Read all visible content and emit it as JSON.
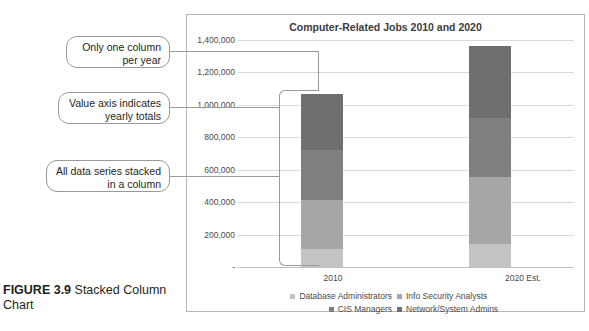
{
  "figure": {
    "label": "FIGURE 3.9",
    "caption": " Stacked Column Chart"
  },
  "callouts": [
    {
      "id": "one-column",
      "text": "Only one column per year"
    },
    {
      "id": "value-axis",
      "text": "Value axis indicates yearly totals"
    },
    {
      "id": "stacked",
      "text": "All data series stacked in a column"
    }
  ],
  "chart_data": {
    "type": "bar",
    "subtype": "stacked-column",
    "title": "Computer-Related Jobs 2010 and 2020",
    "xlabel": "",
    "ylabel": "",
    "categories": [
      "2010",
      "2020 Est."
    ],
    "ytick_labels": [
      "-",
      "200,000",
      "400,000",
      "600,000",
      "800,000",
      "1,000,000",
      "1,200,000",
      "1,400,000"
    ],
    "ytick_values": [
      0,
      200000,
      400000,
      600000,
      800000,
      1000000,
      1200000,
      1400000
    ],
    "ylim": [
      0,
      1400000
    ],
    "grid": true,
    "legend_position": "bottom",
    "series": [
      {
        "name": "Network/System Admins",
        "values": [
          347200,
          443800
        ],
        "color": "#6f6f6f"
      },
      {
        "name": "CIS Managers",
        "values": [
          307100,
          363700
        ],
        "color": "#7f7f7f"
      },
      {
        "name": "Info Security Analysts",
        "values": [
          302300,
          411500
        ],
        "color": "#a6a6a6"
      },
      {
        "name": "Database Administrators",
        "values": [
          110800,
          144700
        ],
        "color": "#c4c4c4"
      }
    ],
    "totals": [
      1067400,
      1363700
    ],
    "stack_order_top_to_bottom": [
      "Network/System Admins",
      "CIS Managers",
      "Info Security Analysts",
      "Database Administrators"
    ]
  }
}
